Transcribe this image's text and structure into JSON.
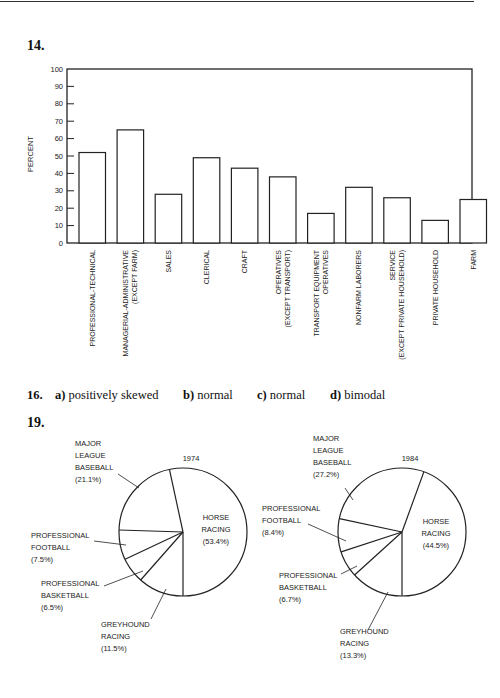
{
  "page": {
    "q14_label": "14.",
    "q16_label": "16.",
    "q19_label": "19."
  },
  "answers16": [
    {
      "letter": "a)",
      "text": "positively skewed"
    },
    {
      "letter": "b)",
      "text": "normal"
    },
    {
      "letter": "c)",
      "text": "normal"
    },
    {
      "letter": "d)",
      "text": "bimodal"
    }
  ],
  "chart_data": [
    {
      "type": "bar",
      "title": "",
      "xlabel": "",
      "ylabel": "PERCENT",
      "ylim": [
        0,
        100
      ],
      "yticks": [
        0,
        10,
        20,
        30,
        40,
        50,
        60,
        70,
        80,
        90,
        100
      ],
      "grid": false,
      "categories": [
        [
          "PROFESSIONAL-TECHNICAL"
        ],
        [
          "MANAGERIAL-ADMINISTRATIVE",
          "(EXCEPT FARM)"
        ],
        [
          "SALES"
        ],
        [
          "CLERICAL"
        ],
        [
          "CRAFT"
        ],
        [
          "OPERATIVES",
          "(EXCEPT TRANSPORT)"
        ],
        [
          "TRANSPORT EQUIPMENT",
          "OPERATIVES"
        ],
        [
          "NONFARM LABORERS"
        ],
        [
          "SERVICE",
          "(EXCEPT PRIVATE HOUSEHOLD)"
        ],
        [
          "PRIVATE HOUSEHOLD"
        ],
        [
          "FARM"
        ]
      ],
      "values": [
        52,
        65,
        28,
        49,
        43,
        38,
        17,
        32,
        26,
        13,
        25
      ]
    },
    {
      "type": "pie",
      "title": "1974",
      "slices": [
        {
          "label": [
            "HORSE",
            "RACING",
            "(53.4%)"
          ],
          "value": 53.4
        },
        {
          "label": [
            "GREYHOUND",
            "RACING",
            "(11.5%)"
          ],
          "value": 11.5
        },
        {
          "label": [
            "PROFESSIONAL",
            "BASKETBALL",
            "(6.5%)"
          ],
          "value": 6.5
        },
        {
          "label": [
            "PROFESSIONAL",
            "FOOTBALL",
            "(7.5%)"
          ],
          "value": 7.5
        },
        {
          "label": [
            "MAJOR",
            "LEAGUE",
            "BASEBALL",
            "(21.1%)"
          ],
          "value": 21.1
        }
      ]
    },
    {
      "type": "pie",
      "title": "1984",
      "slices": [
        {
          "label": [
            "HORSE",
            "RACING",
            "(44.5%)"
          ],
          "value": 44.5
        },
        {
          "label": [
            "GREYHOUND",
            "RACING",
            "(13.3%)"
          ],
          "value": 13.3
        },
        {
          "label": [
            "PROFESSIONAL",
            "BASKETBALL",
            "(6.7%)"
          ],
          "value": 6.7
        },
        {
          "label": [
            "PROFESSIONAL",
            "FOOTBALL",
            "(8.4%)"
          ],
          "value": 8.4
        },
        {
          "label": [
            "MAJOR",
            "LEAGUE",
            "BASEBALL",
            "(27.2%)"
          ],
          "value": 27.2
        }
      ]
    }
  ]
}
